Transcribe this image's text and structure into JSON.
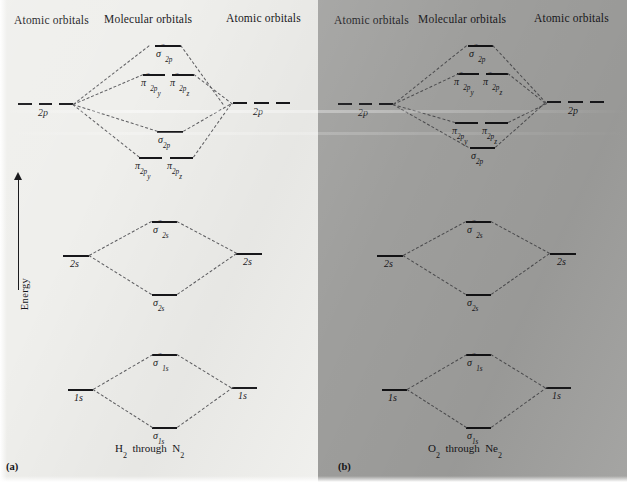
{
  "figure": {
    "energy_axis_label": "Energy",
    "background_color_left": "#efefec",
    "background_color_right": "#9e9e9c"
  },
  "panels": [
    {
      "tag": "(a)",
      "caption_html": "H₂  through  N₂",
      "caption_text": "H2 through N2",
      "headers": {
        "left": "Atomic orbitals",
        "center": "Molecular orbitals",
        "right": "Atomic orbitals"
      },
      "blocks": [
        {
          "name": "2p-block",
          "atomic_label": "2p",
          "levels": [
            {
              "key": "sigma_2p_star",
              "label": "σ*2p",
              "role": "antibonding"
            },
            {
              "key": "pi_2py_star",
              "label": "π*2py",
              "role": "antibonding"
            },
            {
              "key": "pi_2pz_star",
              "label": "π*2pz",
              "role": "antibonding"
            },
            {
              "key": "sigma_2p",
              "label": "σ2p",
              "role": "bonding"
            },
            {
              "key": "pi_2py",
              "label": "π2py",
              "role": "bonding"
            },
            {
              "key": "pi_2pz",
              "label": "π2pz",
              "role": "bonding"
            }
          ],
          "ordering_note": "sigma_2p above pi_2p"
        },
        {
          "name": "2s-block",
          "atomic_label": "2s",
          "levels": [
            {
              "key": "sigma_2s_star",
              "label": "σ*2s",
              "role": "antibonding"
            },
            {
              "key": "sigma_2s",
              "label": "σ2s",
              "role": "bonding"
            }
          ]
        },
        {
          "name": "1s-block",
          "atomic_label": "1s",
          "levels": [
            {
              "key": "sigma_1s_star",
              "label": "σ*1s",
              "role": "antibonding"
            },
            {
              "key": "sigma_1s",
              "label": "σ1s",
              "role": "bonding"
            }
          ]
        }
      ]
    },
    {
      "tag": "(b)",
      "caption_html": "O₂  through  Ne₂",
      "caption_text": "O2 through Ne2",
      "headers": {
        "left": "Atomic orbitals",
        "center": "Molecular orbitals",
        "right": "Atomic orbitals"
      },
      "blocks": [
        {
          "name": "2p-block",
          "atomic_label": "2p",
          "levels": [
            {
              "key": "sigma_2p_star",
              "label": "σ*2p",
              "role": "antibonding"
            },
            {
              "key": "pi_2py_star",
              "label": "π*2py",
              "role": "antibonding"
            },
            {
              "key": "pi_2pz_star",
              "label": "π*2pz",
              "role": "antibonding"
            },
            {
              "key": "pi_2py",
              "label": "π2py",
              "role": "bonding"
            },
            {
              "key": "pi_2pz",
              "label": "π2pz",
              "role": "bonding"
            },
            {
              "key": "sigma_2p",
              "label": "σ2p",
              "role": "bonding"
            }
          ],
          "ordering_note": "pi_2p above sigma_2p"
        },
        {
          "name": "2s-block",
          "atomic_label": "2s",
          "levels": [
            {
              "key": "sigma_2s_star",
              "label": "σ*2s",
              "role": "antibonding"
            },
            {
              "key": "sigma_2s",
              "label": "σ2s",
              "role": "bonding"
            }
          ]
        },
        {
          "name": "1s-block",
          "atomic_label": "1s",
          "levels": [
            {
              "key": "sigma_1s_star",
              "label": "σ*1s",
              "role": "antibonding"
            },
            {
              "key": "sigma_1s",
              "label": "σ1s",
              "role": "bonding"
            }
          ]
        }
      ]
    }
  ],
  "text": {
    "atomic_orbitals": "Atomic orbitals",
    "molecular_orbitals": "Molecular orbitals",
    "energy": "Energy",
    "tag_a": "(a)",
    "tag_b": "(b)",
    "ao_2p": "2p",
    "ao_2s": "2s",
    "ao_1s": "1s"
  }
}
